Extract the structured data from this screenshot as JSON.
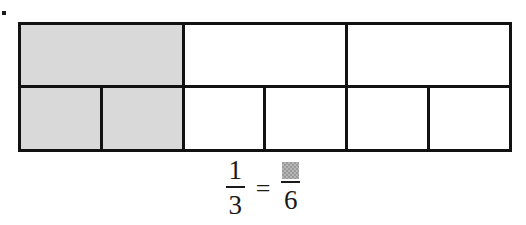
{
  "page": {
    "background_color": "#ffffff",
    "bullet_marker": {
      "name": "item-bullet",
      "color": "#1a1a1a"
    }
  },
  "diagram": {
    "name": "fraction-bar-model",
    "border_color": "#121212",
    "shade_color": "#d9d9d9",
    "unshaded_color": "#ffffff",
    "rows": [
      {
        "name": "thirds-row",
        "denominator": 3,
        "cells": [
          {
            "index": 1,
            "shaded": true
          },
          {
            "index": 2,
            "shaded": false
          },
          {
            "index": 3,
            "shaded": false
          }
        ]
      },
      {
        "name": "sixths-row",
        "denominator": 6,
        "cells": [
          {
            "index": 1,
            "shaded": true
          },
          {
            "index": 2,
            "shaded": true
          },
          {
            "index": 3,
            "shaded": false
          },
          {
            "index": 4,
            "shaded": false
          },
          {
            "index": 5,
            "shaded": false
          },
          {
            "index": 6,
            "shaded": false
          }
        ]
      }
    ]
  },
  "equation": {
    "left_fraction": {
      "numerator": "1",
      "denominator": "3"
    },
    "operator": "=",
    "right_fraction": {
      "numerator": "",
      "numerator_is_blank_box": true,
      "blank_box_color": "#9a9a9a",
      "denominator": "6"
    }
  }
}
